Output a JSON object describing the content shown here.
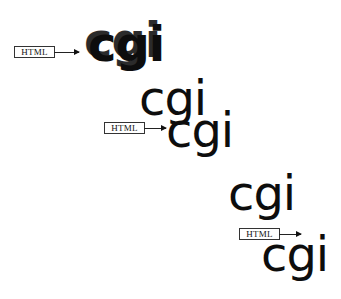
{
  "diagram": {
    "stages": [
      {
        "label": "HTML",
        "output_text": "cgi",
        "output_ghost_text": "cgi",
        "style": "overlapping-bold"
      },
      {
        "output_text_above": "cgi",
        "label": "HTML",
        "output_text": "cgi"
      },
      {
        "output_text_above": "cgi",
        "label": "HTML",
        "output_text": "cgi"
      }
    ],
    "colors": {
      "background": "#ffffff",
      "text": "#0d0d0d",
      "box_border": "#333333"
    }
  }
}
